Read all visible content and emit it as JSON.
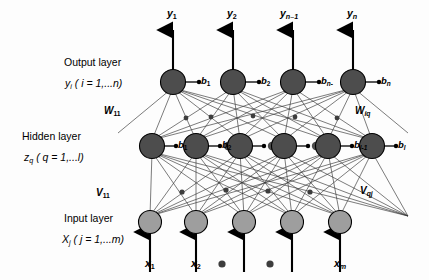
{
  "figure": {
    "background_color": "#fdfdfd",
    "line_color": "#1a1a1a"
  },
  "layers": {
    "output": {
      "title": "Output layer",
      "subscript_notation": "y",
      "index_text": " ( i = 1,...n)",
      "index_var": "i",
      "node_color": "#4d4d4d",
      "node_count": 4,
      "biases": [
        "b",
        "b",
        "b",
        "b"
      ],
      "bias_subs": [
        "1",
        "2",
        "n-",
        "n"
      ],
      "outputs": [
        "y",
        "y",
        "y",
        "y"
      ],
      "output_subs": [
        "1",
        "2",
        "n–1",
        "n"
      ]
    },
    "hidden": {
      "title": "Hidden layer",
      "subscript_notation": "z",
      "index_sub": "q",
      "index_text": " ( q = 1,...l)",
      "node_color": "#4d4d4d",
      "node_count": 6,
      "biases": [
        "b",
        "b",
        "b",
        "b"
      ],
      "bias_subs": [
        "1",
        "2",
        "l-1",
        "l"
      ]
    },
    "input": {
      "title": "Input layer",
      "subscript_notation": "X",
      "index_sub": "j",
      "index_text": " ( j = 1,...m)",
      "node_color": "#9e9e9e",
      "node_count": 5,
      "inputs": [
        "x",
        "x",
        "x"
      ],
      "input_subs": [
        "1",
        "2",
        "m"
      ]
    }
  },
  "weights": {
    "w_left": "W",
    "w_left_sub": "11",
    "w_right": "W",
    "w_right_sub": "iq",
    "v_left": "V",
    "v_left_sub": "11",
    "v_right": "V",
    "v_right_sub": "qj"
  },
  "ellipsis": {
    "glyph": "●",
    "count_output_row": 2,
    "count_hidden_row": 3,
    "count_input_row": 2
  }
}
